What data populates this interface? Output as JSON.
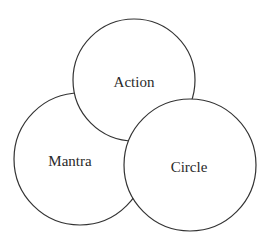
{
  "diagram": {
    "nodes": [
      {
        "id": "mantra",
        "label": "Mantra",
        "cx": 80,
        "cy": 159,
        "r": 66
      },
      {
        "id": "action",
        "label": "Action",
        "cx": 134,
        "cy": 80,
        "r": 61
      },
      {
        "id": "circle",
        "label": "Circle",
        "cx": 190,
        "cy": 165,
        "r": 66
      }
    ],
    "colors": {
      "stroke": "#333333",
      "fill": "#ffffff",
      "text": "#2a2a2a"
    }
  }
}
